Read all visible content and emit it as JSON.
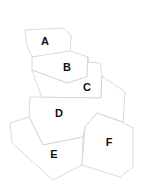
{
  "diagram": {
    "type": "region-map",
    "stroke_color": "#cfcfcf",
    "label_color": "#111111",
    "regions": [
      {
        "id": "A",
        "label": "A",
        "points": "25,30 63,28 71,35 70,55 32,57 27,46",
        "label_x": 45,
        "label_y": 42
      },
      {
        "id": "B",
        "label": "B",
        "points": "32,57 70,51 88,57 87,77 67,83 32,70",
        "label_x": 67,
        "label_y": 68
      },
      {
        "id": "C",
        "label": "C",
        "points": "88,57 88,62 100,63 102,76 101,98 42,98 32,70 67,83 87,77",
        "label_x": 87,
        "label_y": 88
      },
      {
        "id": "D",
        "label": "D",
        "points": "30,97 101,98 102,76 125,92 123,122 97,113 85,127 83,137 43,145 29,117",
        "label_x": 59,
        "label_y": 114
      },
      {
        "id": "E",
        "label": "E",
        "points": "29,117 43,145 83,137 82,165 53,180 12,143 10,123",
        "label_x": 54,
        "label_y": 155
      },
      {
        "id": "F",
        "label": "F",
        "points": "97,113 122,122 133,128 133,167 120,177 82,165 85,127",
        "label_x": 109,
        "label_y": 143
      }
    ]
  }
}
